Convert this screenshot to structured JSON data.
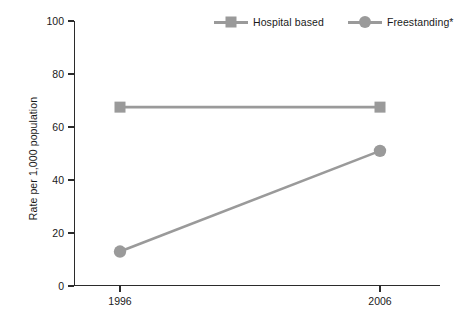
{
  "chart_data": {
    "type": "line",
    "title": "",
    "subtitle": "",
    "xlabel": "",
    "ylabel": "Rate per 1,000 population",
    "categories": [
      "1996",
      "2006"
    ],
    "x": [
      1996,
      2006
    ],
    "xlim": [
      1996,
      2006
    ],
    "ylim": [
      0,
      100
    ],
    "yticks": [
      0,
      20,
      40,
      60,
      80,
      100
    ],
    "ytick_labels": [
      "0",
      "20",
      "40",
      "60",
      "80",
      "100"
    ],
    "xtick_labels": [
      "1996",
      "2006"
    ],
    "grid": false,
    "legend_position": "top-right",
    "series": [
      {
        "name": "Hospital based",
        "marker": "square",
        "color": "#9a9a9a",
        "values": [
          67.5,
          67.5
        ]
      },
      {
        "name": "Freestanding*",
        "marker": "circle",
        "color": "#9a9a9a",
        "values": [
          13,
          51
        ]
      }
    ],
    "annotations": []
  },
  "legend": {
    "entries": [
      {
        "label": "Hospital based",
        "marker": "square-marker-icon"
      },
      {
        "label": "Freestanding*",
        "marker": "circle-marker-icon"
      }
    ]
  },
  "axes": {
    "y_title": "Rate per 1,000 population",
    "y_tick_labels": [
      "100",
      "80",
      "60",
      "40",
      "20",
      "0"
    ],
    "x_tick_labels": [
      "1996",
      "2006"
    ]
  },
  "colors": {
    "series": "#9a9a9a",
    "axis": "#2b2b2b",
    "text": "#1a1a1a",
    "background": "#ffffff"
  }
}
